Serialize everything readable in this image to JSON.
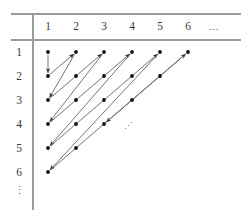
{
  "figure": {
    "column_headers": [
      "1",
      "2",
      "3",
      "4",
      "5",
      "6"
    ],
    "column_ellipsis": "...",
    "row_headers": [
      "1",
      "2",
      "3",
      "4",
      "5",
      "6"
    ],
    "row_ellipsis": "⋮",
    "interior_ellipsis": "⋰",
    "colors": {
      "rule": "#9a9a9a",
      "dot": "#111111",
      "arrow": "#5c5c5c",
      "label": "#3a3a3a",
      "background": "#ffffff"
    },
    "geometry": {
      "col_x": [
        48,
        76,
        104,
        132,
        160,
        188
      ],
      "col_ellipsis_x": 214,
      "row_y": [
        52,
        76,
        100,
        124,
        148,
        172
      ],
      "row_ellipsis_y": 194,
      "row_label_x": 19,
      "header_label_y": 30,
      "vrule_x": 33,
      "vrule_y1": 14,
      "vrule_y2": 210,
      "top_rule_y": 14,
      "bottom_rule_y": 40,
      "rule_x1": 11,
      "rule_x2": 241,
      "dot_radius": 1.9,
      "interior_ellipsis_x": 128,
      "interior_ellipsis_y": 129
    },
    "nodes": [
      {
        "row": 1,
        "col": 1
      },
      {
        "row": 1,
        "col": 2
      },
      {
        "row": 1,
        "col": 3
      },
      {
        "row": 1,
        "col": 4
      },
      {
        "row": 1,
        "col": 5
      },
      {
        "row": 1,
        "col": 6
      },
      {
        "row": 2,
        "col": 1
      },
      {
        "row": 2,
        "col": 2
      },
      {
        "row": 2,
        "col": 3
      },
      {
        "row": 2,
        "col": 4
      },
      {
        "row": 2,
        "col": 5
      },
      {
        "row": 3,
        "col": 1
      },
      {
        "row": 3,
        "col": 2
      },
      {
        "row": 3,
        "col": 3
      },
      {
        "row": 3,
        "col": 4
      },
      {
        "row": 4,
        "col": 1
      },
      {
        "row": 4,
        "col": 2
      },
      {
        "row": 4,
        "col": 3
      },
      {
        "row": 5,
        "col": 1
      },
      {
        "row": 5,
        "col": 2
      },
      {
        "row": 6,
        "col": 1
      }
    ],
    "arrows": [
      {
        "from": {
          "row": 1,
          "col": 1
        },
        "to": {
          "row": 2,
          "col": 1
        },
        "kind": "down"
      },
      {
        "from": {
          "row": 2,
          "col": 1
        },
        "to": {
          "row": 1,
          "col": 2
        },
        "kind": "up-right"
      },
      {
        "from": {
          "row": 1,
          "col": 2
        },
        "to": {
          "row": 3,
          "col": 1
        },
        "kind": "down-left"
      },
      {
        "from": {
          "row": 3,
          "col": 1
        },
        "to": {
          "row": 1,
          "col": 3
        },
        "kind": "up-right"
      },
      {
        "from": {
          "row": 1,
          "col": 3
        },
        "to": {
          "row": 4,
          "col": 1
        },
        "kind": "down-left"
      },
      {
        "from": {
          "row": 4,
          "col": 1
        },
        "to": {
          "row": 1,
          "col": 4
        },
        "kind": "up-right"
      },
      {
        "from": {
          "row": 1,
          "col": 4
        },
        "to": {
          "row": 5,
          "col": 1
        },
        "kind": "down-left"
      },
      {
        "from": {
          "row": 5,
          "col": 1
        },
        "to": {
          "row": 1,
          "col": 5
        },
        "kind": "up-right"
      },
      {
        "from": {
          "row": 1,
          "col": 5
        },
        "to": {
          "row": 6,
          "col": 1
        },
        "kind": "down-left"
      },
      {
        "from": {
          "row": 6,
          "col": 1
        },
        "to": {
          "row": 1,
          "col": 6
        },
        "kind": "up-right"
      },
      {
        "from": {
          "row": 1,
          "col": 6
        },
        "to": {
          "row": 4,
          "col": 3
        },
        "kind": "down-left-partial"
      }
    ]
  }
}
